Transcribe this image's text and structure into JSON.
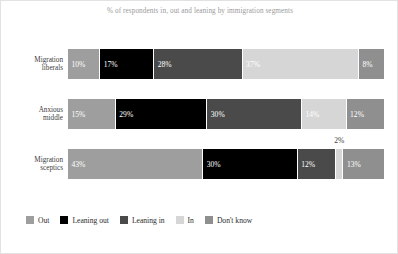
{
  "chart_data": {
    "type": "bar",
    "subtype": "stacked-horizontal-100",
    "title": "% of respondents in, out and leaning by immigration segments",
    "xlabel": "",
    "ylabel": "",
    "xlim": [
      0,
      100
    ],
    "grid": false,
    "legend_position": "bottom-left",
    "categories": [
      "Migration liberals",
      "Anxious middle",
      "Migration sceptics"
    ],
    "series": [
      {
        "name": "Out",
        "color": "#9e9e9e",
        "values": [
          10,
          15,
          43
        ]
      },
      {
        "name": "Leaning out",
        "color": "#000000",
        "values": [
          17,
          29,
          30
        ]
      },
      {
        "name": "Leaning in",
        "color": "#4a4a4a",
        "values": [
          28,
          30,
          12
        ]
      },
      {
        "name": "In",
        "color": "#d6d6d6",
        "values": [
          37,
          14,
          2
        ]
      },
      {
        "name": "Don't know",
        "color": "#8f8f8f",
        "values": [
          8,
          12,
          13
        ]
      }
    ],
    "rows": [
      {
        "label_line1": "Migration",
        "label_line2": "liberals",
        "segments": [
          {
            "series": "Out",
            "value": 10,
            "label": "10%",
            "color": "#9e9e9e",
            "label_outside": false
          },
          {
            "series": "Leaning out",
            "value": 17,
            "label": "17%",
            "color": "#000000",
            "label_outside": false
          },
          {
            "series": "Leaning in",
            "value": 28,
            "label": "28%",
            "color": "#4a4a4a",
            "label_outside": false
          },
          {
            "series": "In",
            "value": 37,
            "label": "37%",
            "color": "#d6d6d6",
            "label_outside": false
          },
          {
            "series": "Don't know",
            "value": 8,
            "label": "8%",
            "color": "#8f8f8f",
            "label_outside": false
          }
        ]
      },
      {
        "label_line1": "Anxious",
        "label_line2": "middle",
        "segments": [
          {
            "series": "Out",
            "value": 15,
            "label": "15%",
            "color": "#9e9e9e",
            "label_outside": false
          },
          {
            "series": "Leaning out",
            "value": 29,
            "label": "29%",
            "color": "#000000",
            "label_outside": false
          },
          {
            "series": "Leaning in",
            "value": 30,
            "label": "30%",
            "color": "#4a4a4a",
            "label_outside": false
          },
          {
            "series": "In",
            "value": 14,
            "label": "14%",
            "color": "#d6d6d6",
            "label_outside": false
          },
          {
            "series": "Don't know",
            "value": 12,
            "label": "12%",
            "color": "#8f8f8f",
            "label_outside": false
          }
        ]
      },
      {
        "label_line1": "Migration",
        "label_line2": "sceptics",
        "segments": [
          {
            "series": "Out",
            "value": 43,
            "label": "43%",
            "color": "#9e9e9e",
            "label_outside": false
          },
          {
            "series": "Leaning out",
            "value": 30,
            "label": "30%",
            "color": "#000000",
            "label_outside": false
          },
          {
            "series": "Leaning in",
            "value": 12,
            "label": "12%",
            "color": "#4a4a4a",
            "label_outside": false
          },
          {
            "series": "In",
            "value": 2,
            "label": "2%",
            "color": "#d6d6d6",
            "label_outside": true
          },
          {
            "series": "Don't know",
            "value": 13,
            "label": "13%",
            "color": "#8f8f8f",
            "label_outside": false
          }
        ]
      }
    ],
    "legend": [
      {
        "label": "Out",
        "color": "#9e9e9e"
      },
      {
        "label": "Leaning out",
        "color": "#000000"
      },
      {
        "label": "Leaning in",
        "color": "#4a4a4a"
      },
      {
        "label": "In",
        "color": "#d6d6d6"
      },
      {
        "label": "Don't know",
        "color": "#8f8f8f"
      }
    ]
  }
}
